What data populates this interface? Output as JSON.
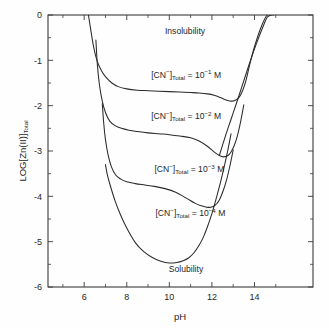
{
  "figure": {
    "background": "#fefefe",
    "line_color": "#2b2b2b",
    "axis_color": "#3a3a3a"
  },
  "axes": {
    "x": {
      "label": "pH",
      "ticks": [
        6,
        8,
        10,
        12,
        14
      ],
      "tick_labels": [
        "6",
        "8",
        "10",
        "12",
        "14"
      ],
      "minor_ticks": [
        5,
        7,
        9,
        11,
        13,
        15
      ],
      "range": [
        4.3,
        16.75
      ]
    },
    "y": {
      "label_parts": {
        "main": "LOG[Zn(II)]",
        "subscript": "Total"
      },
      "label_text": "LOG[Zn(II)]Total",
      "ticks": [
        0,
        -1,
        -2,
        -3,
        -4,
        -5,
        -6
      ],
      "tick_labels": [
        "0",
        "-1",
        "-2",
        "-3",
        "-4",
        "-5",
        "-6"
      ],
      "range": [
        -6,
        0
      ]
    }
  },
  "annotations": {
    "insolubility": "Insolubility",
    "solubility": "Solubility"
  },
  "chart_data": {
    "type": "line",
    "title": "",
    "xlabel": "pH",
    "ylabel": "LOG[Zn(II)]Total",
    "xlim": [
      4.3,
      16.75
    ],
    "ylim": [
      -6,
      0
    ],
    "grid": false,
    "legend_position": "inline-labels",
    "series": [
      {
        "name": "[CN-]Total = 10^-1 M",
        "label_parts": {
          "prefix": "[CN",
          "charge": "−",
          "bracket": "]",
          "subscript": "Total",
          "equals": " = 10",
          "exponent": "−1",
          "unit": " M"
        },
        "label_x": 9.15,
        "label_y": -1.38,
        "x": [
          6.2,
          6.3,
          6.45,
          6.6,
          6.8,
          7.0,
          7.3,
          7.6,
          8.0,
          8.5,
          9.0,
          9.5,
          10.0,
          10.5,
          11.0,
          11.4,
          11.8,
          12.1,
          12.4,
          12.7,
          12.95,
          13.15,
          13.3,
          13.45,
          13.6,
          13.8,
          14.0,
          14.3,
          14.6,
          14.9
        ],
        "y": [
          0.0,
          -0.3,
          -0.72,
          -1.0,
          -1.22,
          -1.36,
          -1.5,
          -1.58,
          -1.63,
          -1.66,
          -1.67,
          -1.68,
          -1.69,
          -1.7,
          -1.71,
          -1.72,
          -1.74,
          -1.77,
          -1.82,
          -1.88,
          -1.9,
          -1.87,
          -1.8,
          -1.66,
          -1.45,
          -1.05,
          -0.7,
          -0.28,
          0.0,
          0.0
        ]
      },
      {
        "name": "[CN-]Total = 10^-2 M",
        "label_parts": {
          "prefix": "[CN",
          "charge": "−",
          "bracket": "]",
          "subscript": "Total",
          "equals": " = 10",
          "exponent": "−2",
          "unit": " M"
        },
        "label_x": 9.15,
        "label_y": -2.29,
        "x": [
          6.55,
          6.62,
          6.72,
          6.85,
          7.0,
          7.2,
          7.45,
          7.75,
          8.1,
          8.5,
          9.0,
          9.5,
          10.0,
          10.5,
          11.0,
          11.4,
          11.8,
          12.1,
          12.35,
          12.55,
          12.75,
          12.9,
          13.05,
          13.2,
          13.35,
          13.5
        ],
        "y": [
          -0.55,
          -1.1,
          -1.55,
          -1.9,
          -2.15,
          -2.34,
          -2.44,
          -2.5,
          -2.54,
          -2.57,
          -2.6,
          -2.62,
          -2.64,
          -2.67,
          -2.71,
          -2.78,
          -2.9,
          -3.02,
          -3.1,
          -3.13,
          -3.1,
          -3.02,
          -2.88,
          -2.66,
          -2.35,
          -1.98
        ]
      },
      {
        "name": "[CN-]Total = 10^-3 M",
        "label_parts": {
          "prefix": "[CN",
          "charge": "−",
          "bracket": "]",
          "subscript": "Total",
          "equals": " = 10",
          "exponent": "−3",
          "unit": " M"
        },
        "label_x": 9.3,
        "label_y": -3.46,
        "x": [
          6.85,
          6.92,
          7.0,
          7.12,
          7.28,
          7.48,
          7.72,
          8.0,
          8.4,
          8.85,
          9.3,
          9.8,
          10.3,
          10.8,
          11.2,
          11.5,
          11.75,
          11.95,
          12.15,
          12.35,
          12.55,
          12.7,
          12.85,
          13.0
        ],
        "y": [
          -1.95,
          -2.4,
          -2.75,
          -3.08,
          -3.35,
          -3.53,
          -3.62,
          -3.68,
          -3.72,
          -3.75,
          -3.78,
          -3.83,
          -3.91,
          -4.04,
          -4.15,
          -4.21,
          -4.24,
          -4.24,
          -4.2,
          -4.08,
          -3.85,
          -3.62,
          -3.32,
          -2.98
        ]
      },
      {
        "name": "[CN-]Total = 10^-4 M",
        "label_parts": {
          "prefix": "[CN",
          "charge": "−",
          "bracket": "]",
          "subscript": "Total",
          "equals": " = 10",
          "exponent": "−4",
          "unit": " M"
        },
        "label_x": 9.35,
        "label_y": -4.44,
        "x": [
          7.0,
          7.1,
          7.25,
          7.45,
          7.7,
          8.0,
          8.4,
          8.8,
          9.2,
          9.6,
          10.0,
          10.35,
          10.65,
          10.9,
          11.15,
          11.4,
          11.6,
          11.8,
          12.0,
          12.2,
          12.4,
          12.6,
          12.75,
          12.9
        ],
        "y": [
          -3.3,
          -3.55,
          -3.8,
          -4.1,
          -4.4,
          -4.7,
          -5.02,
          -5.22,
          -5.35,
          -5.43,
          -5.47,
          -5.46,
          -5.42,
          -5.36,
          -5.25,
          -5.08,
          -4.9,
          -4.66,
          -4.38,
          -4.05,
          -3.7,
          -3.3,
          -2.98,
          -2.62
        ]
      },
      {
        "name": "common-rising-branch",
        "x": [
          12.35,
          12.6,
          12.9,
          13.2,
          13.5,
          13.8,
          14.1,
          14.4,
          14.6,
          14.8
        ],
        "y": [
          -3.1,
          -2.72,
          -2.3,
          -1.88,
          -1.45,
          -1.02,
          -0.62,
          -0.26,
          -0.05,
          0.0
        ]
      }
    ]
  }
}
